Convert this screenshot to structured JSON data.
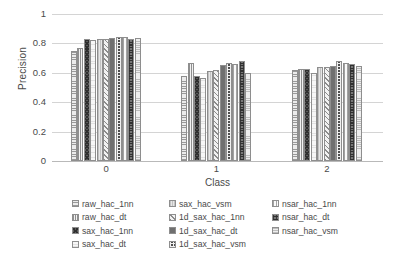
{
  "chart_data": {
    "type": "bar",
    "title": "",
    "xlabel": "Class",
    "ylabel": "Precision",
    "categories": [
      "0",
      "1",
      "2"
    ],
    "ylim": [
      0,
      1
    ],
    "ytick_labels": [
      "1",
      "0.8",
      "0.6",
      "0.4",
      "0.2",
      "0"
    ],
    "ytick_values": [
      1,
      0.8,
      0.6,
      0.4,
      0.2,
      0
    ],
    "grid": true,
    "legend_position": "bottom",
    "series": [
      {
        "name": "raw_hac_1nn",
        "values": [
          0.75,
          0.577,
          0.618
        ]
      },
      {
        "name": "raw_hac_dt",
        "values": [
          0.77,
          0.67,
          0.625
        ]
      },
      {
        "name": "sax_hac_1nn",
        "values": [
          0.83,
          0.58,
          0.625
        ]
      },
      {
        "name": "sax_hac_dt",
        "values": [
          0.825,
          0.568,
          0.6
        ]
      },
      {
        "name": "sax_hac_vsm",
        "values": [
          0.828,
          0.615,
          0.64
        ]
      },
      {
        "name": "1d_sax_hac_1nn",
        "values": [
          0.833,
          0.618,
          0.638
        ]
      },
      {
        "name": "1d_sax_hac_dt",
        "values": [
          0.84,
          0.65,
          0.648
        ]
      },
      {
        "name": "1d_sax_hac_vsm",
        "values": [
          0.845,
          0.665,
          0.678
        ]
      },
      {
        "name": "nsar_hac_1nn",
        "values": [
          0.845,
          0.662,
          0.668
        ]
      },
      {
        "name": "nsar_hac_dt",
        "values": [
          0.828,
          0.683,
          0.658
        ]
      },
      {
        "name": "nsar_hac_vsm",
        "values": [
          0.838,
          0.6,
          0.643
        ]
      }
    ]
  },
  "axes": {
    "y_title": "Precision",
    "x_title": "Class"
  },
  "colors": {
    "gridline": "#d4d4d4",
    "axis_line": "#b9b9b9",
    "text": "#4a4a4a",
    "background": "#ffffff"
  }
}
